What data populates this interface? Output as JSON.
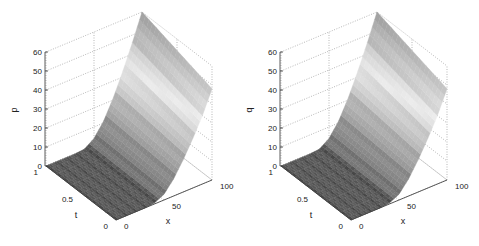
{
  "chart_data": [
    {
      "type": "surface",
      "title": "",
      "zlabel": "p",
      "xlabel": "x",
      "ylabel": "t",
      "zticks": [
        "0",
        "10",
        "20",
        "30",
        "40",
        "50",
        "60"
      ],
      "xticks": [
        "0",
        "50",
        "100"
      ],
      "tticks": [
        "0",
        "0.5",
        "1"
      ],
      "zlim": [
        0,
        60
      ],
      "xlim": [
        0,
        100
      ],
      "tlim": [
        0,
        1
      ],
      "grid": true,
      "colormap": "gray",
      "description": "Surface is ~0 for x<40, rising smoothly to ~60 at x=100,t=1 and ~48 at x=100,t=0",
      "x": [
        0,
        10,
        20,
        30,
        40,
        50,
        60,
        70,
        80,
        90,
        100
      ],
      "t": [
        0,
        0.25,
        0.5,
        0.75,
        1
      ],
      "z_at_t0": [
        0,
        0,
        0,
        0,
        0.5,
        3,
        9,
        17,
        26,
        36,
        48
      ],
      "z_at_t1": [
        0,
        0,
        0,
        0,
        0.5,
        4,
        11,
        21,
        33,
        46,
        60
      ]
    },
    {
      "type": "surface",
      "title": "",
      "zlabel": "q",
      "xlabel": "x",
      "ylabel": "t",
      "zticks": [
        "0",
        "10",
        "20",
        "30",
        "40",
        "50",
        "60"
      ],
      "xticks": [
        "0",
        "50",
        "100"
      ],
      "tticks": [
        "0",
        "0.5",
        "1"
      ],
      "zlim": [
        0,
        60
      ],
      "xlim": [
        0,
        100
      ],
      "tlim": [
        0,
        1
      ],
      "grid": true,
      "colormap": "gray",
      "description": "Surface is ~0 for x<40, rising smoothly to ~60 at x=100,t=1 and ~48 at x=100,t=0",
      "x": [
        0,
        10,
        20,
        30,
        40,
        50,
        60,
        70,
        80,
        90,
        100
      ],
      "t": [
        0,
        0.25,
        0.5,
        0.75,
        1
      ],
      "z_at_t0": [
        0,
        0,
        0,
        0,
        0.5,
        3,
        9,
        17,
        26,
        36,
        48
      ],
      "z_at_t1": [
        0,
        0,
        0,
        0,
        0.5,
        4,
        11,
        21,
        33,
        46,
        60
      ]
    }
  ],
  "panels": [
    {
      "zlabel": "p",
      "xlabel": "x",
      "tlabel": "t",
      "zticks": [
        "0",
        "10",
        "20",
        "30",
        "40",
        "50",
        "60"
      ],
      "xticks": [
        "0",
        "50",
        "100"
      ],
      "tticks": [
        "0",
        "0.5",
        "1"
      ]
    },
    {
      "zlabel": "q",
      "xlabel": "x",
      "tlabel": "t",
      "zticks": [
        "0",
        "10",
        "20",
        "30",
        "40",
        "50",
        "60"
      ],
      "xticks": [
        "0",
        "50",
        "100"
      ],
      "tticks": [
        "0",
        "0.5",
        "1"
      ]
    }
  ]
}
